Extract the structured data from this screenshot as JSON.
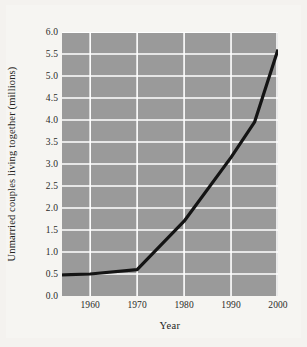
{
  "chart_data": {
    "type": "line",
    "title": "",
    "xlabel": "Year",
    "ylabel": "Unmarried couples living together (millions)",
    "xlim": [
      1954,
      2000
    ],
    "ylim": [
      0.0,
      6.0
    ],
    "grid": true,
    "legend": "none",
    "background": "#9a9a9a",
    "gridline_color": "#ffffff",
    "line_color": "#141414",
    "x_ticks": [
      "1960",
      "1970",
      "1980",
      "1990",
      "2000"
    ],
    "x_tick_values": [
      1960,
      1970,
      1980,
      1990,
      2000
    ],
    "y_ticks": [
      "0.0",
      "0.5",
      "1.0",
      "1.5",
      "2.0",
      "2.5",
      "3.0",
      "3.5",
      "4.0",
      "4.5",
      "5.0",
      "5.5",
      "6.0"
    ],
    "y_tick_values": [
      0.0,
      0.5,
      1.0,
      1.5,
      2.0,
      2.5,
      3.0,
      3.5,
      4.0,
      4.5,
      5.0,
      5.5,
      6.0
    ],
    "x": [
      1954,
      1960,
      1970,
      1980,
      1990,
      1995,
      2000
    ],
    "values": [
      0.48,
      0.5,
      0.6,
      1.7,
      3.15,
      3.95,
      5.6
    ],
    "series": [
      {
        "name": "Unmarried couples living together",
        "x": [
          1954,
          1960,
          1970,
          1980,
          1990,
          1995,
          2000
        ],
        "values": [
          0.48,
          0.5,
          0.6,
          1.7,
          3.15,
          3.95,
          5.6
        ]
      }
    ]
  },
  "figure": {
    "page_background": "#f4f2ef",
    "panel_background": "#f6f5f2"
  }
}
